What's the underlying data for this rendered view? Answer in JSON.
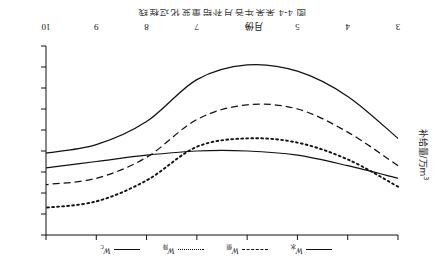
{
  "caption": "图 4-4  某某年各月补给量变化过程线",
  "axes": {
    "xlabel": "月份",
    "ylabel_text": "补给量/万m",
    "ylabel_sup": "3",
    "xticks": [
      "3",
      "4",
      "5",
      "6",
      "7",
      "8",
      "9",
      "10"
    ],
    "yticks": [
      "0",
      "1000",
      "2000",
      "3000",
      "4000",
      "5000",
      "6000",
      "7000",
      "8000",
      "9000"
    ]
  },
  "legend": [
    {
      "label_main": "W",
      "label_sub": "水",
      "style": "solid",
      "name": "legend-item-w-shui"
    },
    {
      "label_main": "W",
      "label_sub": "侧",
      "style": "dashed",
      "name": "legend-item-w-ce"
    },
    {
      "label_main": "W",
      "label_sub": "降",
      "style": "dotted",
      "name": "legend-item-w-jiang"
    },
    {
      "label_main": "W",
      "label_sub": "C",
      "style": "solid",
      "name": "legend-item-w-c"
    }
  ],
  "chart_data": {
    "type": "line",
    "title": "图 4-4  某某年各月补给量变化过程线",
    "xlabel": "月份",
    "ylabel": "补给量/万m3",
    "x": [
      3,
      4,
      5,
      6,
      7,
      8,
      9,
      10
    ],
    "xlim": [
      3,
      10
    ],
    "ylim": [
      0,
      9000
    ],
    "yticks": [
      0,
      1000,
      2000,
      3000,
      4000,
      5000,
      6000,
      7000,
      8000,
      9000
    ],
    "grid": false,
    "legend_position": "bottom",
    "series": [
      {
        "name": "W水",
        "style": "solid",
        "values": [
          4600,
          6600,
          7800,
          8100,
          7400,
          5400,
          4300,
          3900
        ]
      },
      {
        "name": "W侧",
        "style": "dashed",
        "values": [
          3300,
          4900,
          6000,
          6200,
          5500,
          3700,
          2700,
          2400
        ]
      },
      {
        "name": "W降",
        "style": "dotted",
        "values": [
          2300,
          3600,
          4400,
          4600,
          4200,
          2600,
          1600,
          1300
        ]
      },
      {
        "name": "Wₑᶜ",
        "style": "solid",
        "values": [
          2700,
          3300,
          3800,
          4000,
          4000,
          3800,
          3500,
          3200
        ]
      }
    ]
  }
}
